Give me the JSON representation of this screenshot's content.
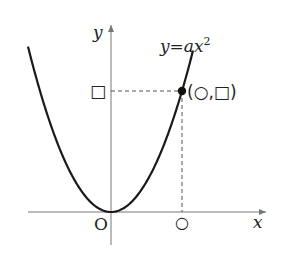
{
  "diagram": {
    "equation_label": "y=ax",
    "equation_exponent": "2",
    "axis_x_label": "x",
    "axis_y_label": "y",
    "origin_label": "O",
    "point_label": "(○,□)",
    "x_tick_label": "○",
    "y_tick_label": "□",
    "colors": {
      "curve": "#1a1a1a",
      "axes": "#777777",
      "dashed": "#555555",
      "text": "#222222"
    }
  }
}
